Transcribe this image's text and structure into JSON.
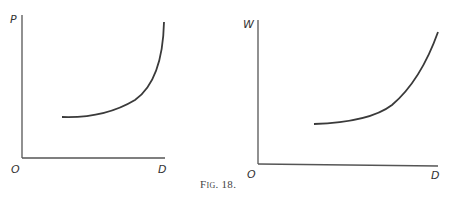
{
  "caption": "Fig. 18.",
  "diagrams": [
    {
      "id": "left",
      "y_label": "P",
      "x_label": "D",
      "origin_label": "O",
      "curve": "convex increasing curve, steepening sharply toward right"
    },
    {
      "id": "right",
      "y_label": "W",
      "x_label": "D",
      "origin_label": "O",
      "curve": "convex increasing curve, rising steadily toward right"
    }
  ],
  "colors": {
    "line": "#3a3a3a",
    "background": "#ffffff"
  }
}
